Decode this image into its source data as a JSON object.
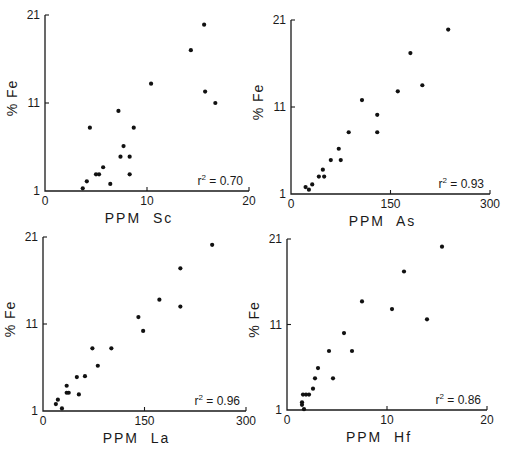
{
  "chart_data": [
    {
      "type": "scatter",
      "title": "",
      "xlabel": "PPM  Sc",
      "ylabel": "% Fe",
      "xlim": [
        0,
        20
      ],
      "ylim": [
        1,
        21
      ],
      "xticks": [
        "0",
        "10",
        "20"
      ],
      "yticks": [
        "1",
        "11",
        "21"
      ],
      "annotation": "r² = 0.70",
      "grid": false,
      "points": [
        [
          3.7,
          1.3
        ],
        [
          4.1,
          2.1
        ],
        [
          4.4,
          8.2
        ],
        [
          5.0,
          2.9
        ],
        [
          5.3,
          2.9
        ],
        [
          5.7,
          3.7
        ],
        [
          6.4,
          1.8
        ],
        [
          7.2,
          10.1
        ],
        [
          7.4,
          4.9
        ],
        [
          7.7,
          6.1
        ],
        [
          8.3,
          4.9
        ],
        [
          8.3,
          2.9
        ],
        [
          8.7,
          8.2
        ],
        [
          10.4,
          13.2
        ],
        [
          14.3,
          17.0
        ],
        [
          15.6,
          19.9
        ],
        [
          15.7,
          12.3
        ],
        [
          16.7,
          11.0
        ]
      ]
    },
    {
      "type": "scatter",
      "title": "",
      "xlabel": "PPM  As",
      "ylabel": "% Fe",
      "xlim": [
        0,
        300
      ],
      "ylim": [
        1,
        21
      ],
      "xticks": [
        "0",
        "150",
        "300"
      ],
      "yticks": [
        "1",
        "11",
        "21"
      ],
      "annotation": "r² = 0.93",
      "grid": false,
      "points": [
        [
          22,
          1.8
        ],
        [
          27,
          1.5
        ],
        [
          32,
          2.1
        ],
        [
          42,
          3.0
        ],
        [
          48,
          3.8
        ],
        [
          50,
          3.0
        ],
        [
          60,
          4.9
        ],
        [
          72,
          6.2
        ],
        [
          75,
          4.9
        ],
        [
          87,
          8.1
        ],
        [
          107,
          11.8
        ],
        [
          130,
          10.1
        ],
        [
          130,
          8.1
        ],
        [
          161,
          12.8
        ],
        [
          180,
          17.2
        ],
        [
          198,
          13.5
        ],
        [
          237,
          19.9
        ]
      ]
    },
    {
      "type": "scatter",
      "title": "",
      "xlabel": "PPM  La",
      "ylabel": "% Fe",
      "xlim": [
        0,
        300
      ],
      "ylim": [
        1,
        21
      ],
      "xticks": [
        "0",
        "150",
        "300"
      ],
      "yticks": [
        "1",
        "11",
        "21"
      ],
      "annotation": "r² = 0.96",
      "grid": false,
      "points": [
        [
          19,
          1.8
        ],
        [
          22,
          2.3
        ],
        [
          28,
          1.3
        ],
        [
          35,
          3.9
        ],
        [
          35,
          3.1
        ],
        [
          38,
          3.1
        ],
        [
          50,
          4.9
        ],
        [
          53,
          2.9
        ],
        [
          62,
          5.0
        ],
        [
          73,
          8.2
        ],
        [
          81,
          6.2
        ],
        [
          101,
          8.2
        ],
        [
          141,
          11.8
        ],
        [
          148,
          10.2
        ],
        [
          172,
          13.8
        ],
        [
          203,
          17.4
        ],
        [
          203,
          13.0
        ],
        [
          250,
          20.1
        ]
      ]
    },
    {
      "type": "scatter",
      "title": "",
      "xlabel": "PPM  Hf",
      "ylabel": "% Fe",
      "xlim": [
        0,
        20
      ],
      "ylim": [
        1,
        21
      ],
      "xticks": [
        "0",
        "10",
        "20"
      ],
      "yticks": [
        "1",
        "11",
        "21"
      ],
      "annotation": "r² = 0.86",
      "grid": false,
      "points": [
        [
          1.5,
          1.9
        ],
        [
          1.5,
          1.6
        ],
        [
          1.7,
          1.1
        ],
        [
          1.6,
          2.8
        ],
        [
          1.9,
          2.8
        ],
        [
          2.2,
          2.8
        ],
        [
          2.6,
          3.5
        ],
        [
          2.8,
          4.7
        ],
        [
          3.1,
          5.9
        ],
        [
          4.2,
          7.9
        ],
        [
          4.6,
          4.7
        ],
        [
          5.7,
          10.0
        ],
        [
          6.5,
          7.9
        ],
        [
          7.5,
          13.7
        ],
        [
          10.5,
          12.8
        ],
        [
          11.7,
          17.2
        ],
        [
          14.0,
          11.6
        ],
        [
          15.5,
          20.1
        ]
      ]
    }
  ],
  "panels": [
    {
      "xlabel": "PPM  Sc",
      "ylabel": "% Fe",
      "r2": "0.70",
      "xticks": [
        "0",
        "10",
        "20"
      ],
      "yticks": [
        "1",
        "11",
        "21"
      ]
    },
    {
      "xlabel": "PPM  As",
      "ylabel": "% Fe",
      "r2": "0.93",
      "xticks": [
        "0",
        "150",
        "300"
      ],
      "yticks": [
        "1",
        "11",
        "21"
      ]
    },
    {
      "xlabel": "PPM  La",
      "ylabel": "% Fe",
      "r2": "0.96",
      "xticks": [
        "0",
        "150",
        "300"
      ],
      "yticks": [
        "1",
        "11",
        "21"
      ]
    },
    {
      "xlabel": "PPM  Hf",
      "ylabel": "% Fe",
      "r2": "0.86",
      "xticks": [
        "0",
        "10",
        "20"
      ],
      "yticks": [
        "1",
        "11",
        "21"
      ]
    }
  ],
  "r2_prefix": "r",
  "r2_sup": "2",
  "r2_eq": " = "
}
